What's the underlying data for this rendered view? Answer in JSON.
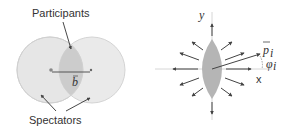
{
  "left_panel": {
    "label_participants": "Participants",
    "label_spectators": "Spectators",
    "impact_vector": "b"
  },
  "right_panel": {
    "axis_y": "y",
    "axis_x": "x",
    "momentum_label": "p",
    "momentum_subscript": "i",
    "angle_label": "φ",
    "angle_subscript": "i"
  },
  "colors": {
    "nucleus_fill": "#e6e6e6",
    "nucleus_stroke": "#d0d0d0",
    "overlap_fill": "#c8c8c8",
    "arrow": "#444444"
  }
}
